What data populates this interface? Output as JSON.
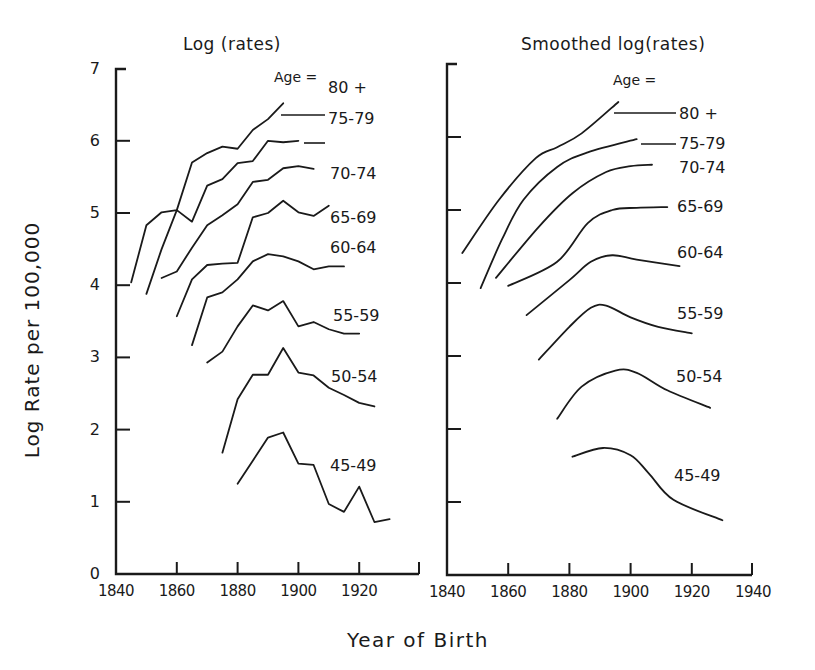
{
  "figure": {
    "ylabel": "Log Rate per 100,000",
    "xlabel": "Year of Birth",
    "age_heading": "Age ="
  },
  "chart_data": [
    {
      "type": "line",
      "title": "Log (rates)",
      "xlabel": "Year of Birth",
      "ylabel": "Log Rate per 100,000",
      "xlim": [
        1840,
        1940
      ],
      "ylim": [
        0,
        7
      ],
      "xticks": [
        "1840",
        "1860",
        "1880",
        "1900",
        "1920"
      ],
      "yticks": [
        "0",
        "1",
        "2",
        "3",
        "4",
        "5",
        "6",
        "7"
      ],
      "grid": false,
      "legend": "inline labels at right end of curves, headed 'Age ='",
      "series": [
        {
          "name": "80 +",
          "x": [
            1845,
            1850,
            1855,
            1860,
            1865,
            1870,
            1875,
            1880,
            1885,
            1890,
            1895
          ],
          "y": [
            4.04,
            4.83,
            5.01,
            5.04,
            5.7,
            5.83,
            5.92,
            5.89,
            6.15,
            6.3,
            6.52
          ]
        },
        {
          "name": "75-79",
          "x": [
            1850,
            1855,
            1860,
            1865,
            1870,
            1875,
            1880,
            1885,
            1890,
            1895,
            1900
          ],
          "y": [
            3.88,
            4.5,
            5.04,
            4.88,
            5.38,
            5.47,
            5.69,
            5.72,
            6.0,
            5.98,
            6.0
          ]
        },
        {
          "name": "70-74",
          "x": [
            1855,
            1860,
            1865,
            1870,
            1875,
            1880,
            1885,
            1890,
            1895,
            1900,
            1905
          ],
          "y": [
            4.1,
            4.19,
            4.52,
            4.83,
            4.97,
            5.12,
            5.43,
            5.46,
            5.62,
            5.65,
            5.61
          ]
        },
        {
          "name": "65-69",
          "x": [
            1860,
            1865,
            1870,
            1875,
            1880,
            1885,
            1890,
            1895,
            1900,
            1905,
            1910
          ],
          "y": [
            3.57,
            4.08,
            4.28,
            4.3,
            4.31,
            4.94,
            5.0,
            5.17,
            5.01,
            4.96,
            5.1
          ]
        },
        {
          "name": "60-64",
          "x": [
            1865,
            1870,
            1875,
            1880,
            1885,
            1890,
            1895,
            1900,
            1905,
            1910,
            1915
          ],
          "y": [
            3.17,
            3.83,
            3.9,
            4.08,
            4.33,
            4.43,
            4.4,
            4.33,
            4.22,
            4.26,
            4.26
          ]
        },
        {
          "name": "55-59",
          "x": [
            1870,
            1875,
            1880,
            1885,
            1890,
            1895,
            1900,
            1905,
            1910,
            1915,
            1920
          ],
          "y": [
            2.93,
            3.08,
            3.43,
            3.72,
            3.65,
            3.78,
            3.43,
            3.49,
            3.39,
            3.33,
            3.33
          ]
        },
        {
          "name": "50-54",
          "x": [
            1875,
            1880,
            1885,
            1890,
            1895,
            1900,
            1905,
            1910,
            1915,
            1920,
            1925
          ],
          "y": [
            1.68,
            2.42,
            2.76,
            2.76,
            3.13,
            2.79,
            2.75,
            2.58,
            2.48,
            2.37,
            2.32
          ]
        },
        {
          "name": "45-49",
          "x": [
            1880,
            1885,
            1890,
            1895,
            1900,
            1905,
            1910,
            1915,
            1920,
            1925,
            1930
          ],
          "y": [
            1.25,
            1.57,
            1.89,
            1.96,
            1.53,
            1.51,
            0.97,
            0.86,
            1.21,
            0.72,
            0.76
          ]
        }
      ]
    },
    {
      "type": "line",
      "title": "Smoothed log(rates)",
      "xlabel": "Year of Birth",
      "ylabel": "Log Rate per 100,000",
      "xlim": [
        1840,
        1940
      ],
      "ylim": [
        0,
        7
      ],
      "xticks": [
        "1840",
        "1860",
        "1880",
        "1900",
        "1920",
        "1940"
      ],
      "yticks": [],
      "grid": false,
      "legend": "inline labels at right end of curves, headed 'Age ='",
      "series": [
        {
          "name": "80 +",
          "x": [
            1845,
            1857,
            1869,
            1876,
            1884,
            1896
          ],
          "y": [
            4.41,
            5.14,
            5.71,
            5.86,
            6.05,
            6.48
          ]
        },
        {
          "name": "75-79",
          "x": [
            1851,
            1858,
            1865,
            1876,
            1886,
            1902
          ],
          "y": [
            3.93,
            4.6,
            5.14,
            5.59,
            5.79,
            5.97
          ]
        },
        {
          "name": "70-74",
          "x": [
            1856,
            1870,
            1881,
            1892,
            1900,
            1907
          ],
          "y": [
            4.07,
            4.77,
            5.23,
            5.52,
            5.6,
            5.62
          ]
        },
        {
          "name": "65-69",
          "x": [
            1860,
            1876,
            1886,
            1894,
            1902,
            1912
          ],
          "y": [
            3.96,
            4.29,
            4.82,
            5.0,
            5.03,
            5.04
          ]
        },
        {
          "name": "60-64",
          "x": [
            1866,
            1880,
            1887,
            1894,
            1902,
            1916
          ],
          "y": [
            3.56,
            4.04,
            4.29,
            4.38,
            4.32,
            4.23
          ]
        },
        {
          "name": "55-59",
          "x": [
            1870,
            1880,
            1887,
            1892,
            1900,
            1909,
            1920
          ],
          "y": [
            2.95,
            3.4,
            3.66,
            3.69,
            3.53,
            3.4,
            3.31
          ]
        },
        {
          "name": "50-54",
          "x": [
            1876,
            1884,
            1895,
            1902,
            1912,
            1926
          ],
          "y": [
            2.14,
            2.58,
            2.8,
            2.77,
            2.53,
            2.29
          ]
        },
        {
          "name": "45-49",
          "x": [
            1881,
            1891,
            1900,
            1906,
            1914,
            1930
          ],
          "y": [
            1.62,
            1.74,
            1.64,
            1.39,
            1.03,
            0.75
          ]
        }
      ]
    }
  ]
}
